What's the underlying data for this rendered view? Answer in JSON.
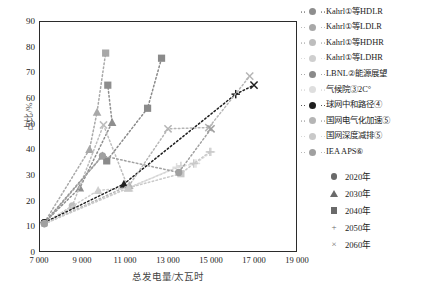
{
  "chart_data": {
    "type": "scatter",
    "title": "",
    "xlabel": "总发电量/太瓦时",
    "ylabel": "占比/%",
    "xlim": [
      7000,
      19000
    ],
    "ylim": [
      0,
      90
    ],
    "xticks": [
      "7 000",
      "9 000",
      "11 000",
      "13 000",
      "15 000",
      "17 000",
      "19 000"
    ],
    "xtick_values": [
      7000,
      9000,
      11000,
      13000,
      15000,
      17000,
      19000
    ],
    "yticks": [
      "0",
      "10",
      "20",
      "30",
      "40",
      "50",
      "60",
      "70",
      "80",
      "90"
    ],
    "ytick_values": [
      0,
      10,
      20,
      30,
      40,
      50,
      60,
      70,
      80,
      90
    ],
    "grid": false,
    "legend_position": "right",
    "marker_legend": [
      {
        "label": "2020年",
        "marker": "circle"
      },
      {
        "label": "2030年",
        "marker": "triangle"
      },
      {
        "label": "2040年",
        "marker": "square"
      },
      {
        "label": "2050年",
        "marker": "plus"
      },
      {
        "label": "2060年",
        "marker": "cross"
      }
    ],
    "series": [
      {
        "name": "Kahrl等HDLR",
        "name_html": "Kahrl<sup>①</sup>等HDLR",
        "color": "#8e8e8e",
        "points": [
          {
            "x": 7250,
            "y": 11.5,
            "marker": "circle"
          },
          {
            "x": 8900,
            "y": 25.0,
            "marker": "triangle"
          },
          {
            "x": 10400,
            "y": 50.5,
            "marker": "triangle"
          },
          {
            "x": 10200,
            "y": 65.0,
            "marker": "square"
          }
        ]
      },
      {
        "name": "Kahrl等LDLR",
        "name_html": "Kahrl<sup>①</sup>等LDLR",
        "color": "#a8a8a8",
        "points": [
          {
            "x": 7250,
            "y": 11.5,
            "marker": "circle"
          },
          {
            "x": 9350,
            "y": 40.0,
            "marker": "triangle"
          },
          {
            "x": 9700,
            "y": 54.5,
            "marker": "triangle"
          },
          {
            "x": 10100,
            "y": 77.5,
            "marker": "square"
          }
        ]
      },
      {
        "name": "Kahrl等HDHR",
        "name_html": "Kahrl<sup>①</sup>等HDHR",
        "color": "#bdbdbd",
        "points": [
          {
            "x": 7250,
            "y": 11.0,
            "marker": "circle"
          },
          {
            "x": 8550,
            "y": 18.0,
            "marker": "circle"
          },
          {
            "x": 10000,
            "y": 49.5,
            "marker": "cross"
          },
          {
            "x": 11150,
            "y": 25.0,
            "marker": "triangle"
          }
        ]
      },
      {
        "name": "Kahrl等LDHR",
        "name_html": "Kahrl<sup>①</sup>等LDHR",
        "color": "#cfcfcf",
        "points": [
          {
            "x": 7250,
            "y": 11.0,
            "marker": "circle"
          },
          {
            "x": 9750,
            "y": 24.0,
            "marker": "triangle"
          },
          {
            "x": 11150,
            "y": 25.0,
            "marker": "triangle"
          },
          {
            "x": 13600,
            "y": 33.5,
            "marker": "plus"
          }
        ]
      },
      {
        "name": "LBNL能源展望",
        "name_html": "LBNL<sup>②</sup>能源展望",
        "color": "#8a8a8a",
        "points": [
          {
            "x": 7250,
            "y": 11.5,
            "marker": "circle"
          },
          {
            "x": 9950,
            "y": 37.5,
            "marker": "triangle"
          },
          {
            "x": 10150,
            "y": 35.5,
            "marker": "square"
          },
          {
            "x": 12050,
            "y": 56.0,
            "marker": "square"
          },
          {
            "x": 12700,
            "y": 75.5,
            "marker": "square"
          }
        ]
      },
      {
        "name": "气候院2C°",
        "name_html": "气候院<sup>③</sup>2C°",
        "color": "#dedede",
        "points": [
          {
            "x": 7250,
            "y": 11.0,
            "marker": "circle"
          },
          {
            "x": 11200,
            "y": 25.0,
            "marker": "triangle"
          },
          {
            "x": 13400,
            "y": 33.0,
            "marker": "plus"
          },
          {
            "x": 14300,
            "y": 34.5,
            "marker": "plus"
          },
          {
            "x": 15000,
            "y": 39.0,
            "marker": "plus"
          }
        ]
      },
      {
        "name": "球网中和路径",
        "name_html": "球网中和路径<sup>④</sup>",
        "color": "#1f1f1f",
        "points": [
          {
            "x": 7250,
            "y": 11.5,
            "marker": "circle"
          },
          {
            "x": 10950,
            "y": 26.5,
            "marker": "triangle"
          },
          {
            "x": 16150,
            "y": 61.5,
            "marker": "plus"
          },
          {
            "x": 17000,
            "y": 65.0,
            "marker": "cross"
          }
        ]
      },
      {
        "name": "国网电气化加速",
        "name_html": "国网电气化加速<sup>⑤</sup>",
        "color": "#b5b5b5",
        "points": [
          {
            "x": 7250,
            "y": 11.0,
            "marker": "circle"
          },
          {
            "x": 11200,
            "y": 26.0,
            "marker": "triangle"
          },
          {
            "x": 13000,
            "y": 48.0,
            "marker": "cross"
          },
          {
            "x": 14900,
            "y": 48.5,
            "marker": "cross"
          },
          {
            "x": 16800,
            "y": 68.5,
            "marker": "cross"
          }
        ]
      },
      {
        "name": "国网深度减排",
        "name_html": "国网深度减排<sup>⑤</sup>",
        "color": "#c9c9c9",
        "points": [
          {
            "x": 7250,
            "y": 11.0,
            "marker": "circle"
          },
          {
            "x": 11150,
            "y": 25.0,
            "marker": "triangle"
          },
          {
            "x": 13600,
            "y": 30.5,
            "marker": "square"
          },
          {
            "x": 14200,
            "y": 34.5,
            "marker": "plus"
          },
          {
            "x": 14950,
            "y": 39.0,
            "marker": "plus"
          }
        ]
      },
      {
        "name": "IEA APS",
        "name_html": "IEA APS<sup>⑥</sup>",
        "color": "#a0a0a0",
        "points": [
          {
            "x": 7250,
            "y": 11.0,
            "marker": "circle"
          },
          {
            "x": 9950,
            "y": 37.5,
            "marker": "circle"
          },
          {
            "x": 13500,
            "y": 31.0,
            "marker": "circle"
          },
          {
            "x": 15000,
            "y": 48.0,
            "marker": "cross"
          }
        ]
      }
    ]
  },
  "axes": {
    "x_label": "总发电量/太瓦时",
    "y_label": "占比/%"
  },
  "legend": {
    "series_items": [
      {
        "label": "Kahrl①等HDLR",
        "color": "#8e8e8e"
      },
      {
        "label": "Kahrl①等LDLR",
        "color": "#a8a8a8"
      },
      {
        "label": "Kahrl①等HDHR",
        "color": "#bdbdbd"
      },
      {
        "label": "Kahrl①等LDHR",
        "color": "#cfcfcf"
      },
      {
        "label": "LBNL②能源展望",
        "color": "#8a8a8a"
      },
      {
        "label": "气候院③2C°",
        "color": "#dedede"
      },
      {
        "label": "球网中和路径④",
        "color": "#1f1f1f"
      },
      {
        "label": "国网电气化加速⑤",
        "color": "#b5b5b5"
      },
      {
        "label": "国网深度减排⑤",
        "color": "#c9c9c9"
      },
      {
        "label": "IEA APS⑥",
        "color": "#a0a0a0"
      }
    ],
    "year_items": [
      {
        "label": "2020年",
        "marker": "circle"
      },
      {
        "label": "2030年",
        "marker": "triangle"
      },
      {
        "label": "2040年",
        "marker": "square"
      },
      {
        "label": "2050年",
        "marker": "plus"
      },
      {
        "label": "2060年",
        "marker": "cross"
      }
    ]
  }
}
